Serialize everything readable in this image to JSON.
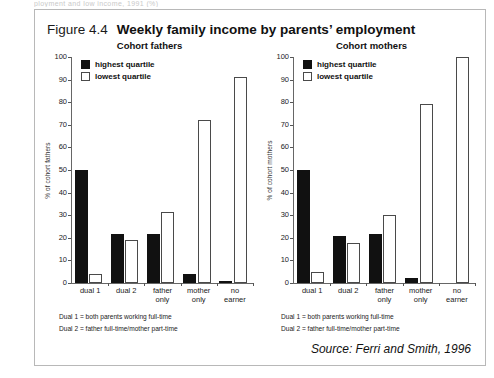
{
  "clipped_top_text": "ployment and low income, 1991 (%)",
  "figure": {
    "number": "Figure 4.4",
    "title": "Weekly family income by parents’ employment",
    "source": "Source: Ferri and Smith, 1996",
    "notes": [
      "Dual 1 = both parents working full-time",
      "Dual 2 = father full-time/mother part-time"
    ]
  },
  "legend": {
    "highest": "highest quartile",
    "lowest": "lowest quartile"
  },
  "chart_data": [
    {
      "type": "bar",
      "title": "Cohort fathers",
      "xlabel": "",
      "ylabel": "% of cohort fathers",
      "ylim": [
        0,
        100
      ],
      "yticks": [
        0,
        10,
        20,
        30,
        40,
        50,
        60,
        70,
        80,
        90,
        100
      ],
      "grid": false,
      "legend_position": "top-left",
      "categories": [
        "dual 1",
        "dual 2",
        "father only",
        "mother only",
        "no earner"
      ],
      "series": [
        {
          "name": "highest quartile",
          "color": "#111111",
          "values": [
            50,
            21.5,
            21.5,
            4,
            1
          ]
        },
        {
          "name": "lowest quartile",
          "color": "#ffffff",
          "values": [
            4,
            19,
            31.5,
            72,
            91
          ]
        }
      ]
    },
    {
      "type": "bar",
      "title": "Cohort mothers",
      "xlabel": "",
      "ylabel": "% of cohort mothers",
      "ylim": [
        0,
        100
      ],
      "yticks": [
        0,
        10,
        20,
        30,
        40,
        50,
        60,
        70,
        80,
        90,
        100
      ],
      "grid": false,
      "legend_position": "top-left",
      "categories": [
        "dual 1",
        "dual 2",
        "father only",
        "mother only",
        "no earner"
      ],
      "series": [
        {
          "name": "highest quartile",
          "color": "#111111",
          "values": [
            50,
            21,
            21.5,
            2,
            0
          ]
        },
        {
          "name": "lowest quartile",
          "color": "#ffffff",
          "values": [
            5,
            17.5,
            30,
            79,
            100
          ]
        }
      ]
    }
  ]
}
